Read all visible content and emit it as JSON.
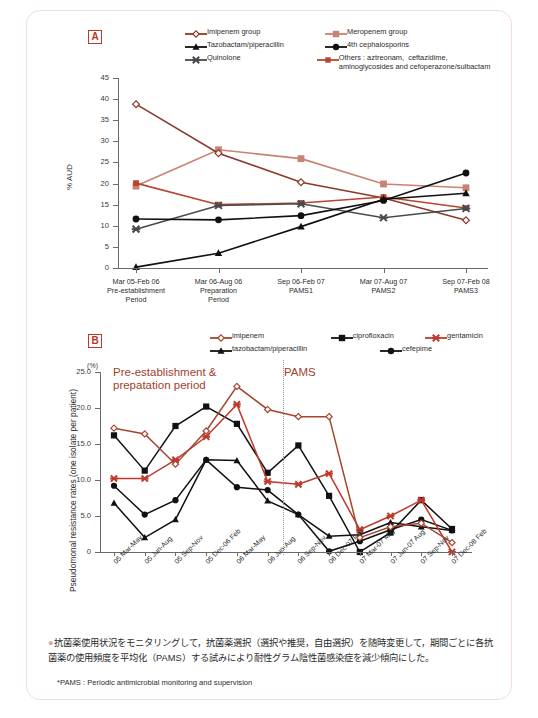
{
  "figure": {
    "panel_a_label": "A",
    "panel_b_label": "B",
    "accent_color": "#b3392b",
    "frame_color": "#f2ddda"
  },
  "panel_a": {
    "badge": "A",
    "ylabel": "% AUD",
    "legend": [
      {
        "label": "Imipenem group",
        "color": "#8c3a2a",
        "marker": "open-diamond"
      },
      {
        "label": "Meropenem group",
        "color": "#c98272",
        "marker": "filled-square"
      },
      {
        "label": "Tazobactam/piperacillin",
        "color": "#111111",
        "marker": "filled-triangle"
      },
      {
        "label": "4th cephalosporins",
        "color": "#111111",
        "marker": "filled-circle"
      },
      {
        "label": "Quinolone",
        "color": "#4a4a4a",
        "marker": "cross-x"
      },
      {
        "label": "Others : aztreonam,  ceftazidime,\naminoglycosides and cefoperazone/sulbactam",
        "color": "#b8452f",
        "marker": "filled-square-small"
      }
    ],
    "chart_data": {
      "type": "line",
      "title": "",
      "xlabel": "",
      "ylabel": "% AUD",
      "ylim": [
        0,
        45
      ],
      "yticks": [
        0,
        5,
        10,
        15,
        20,
        25,
        30,
        35,
        40,
        45
      ],
      "grid": false,
      "legend_position": "top",
      "categories": [
        "Mar 05-Feb 06\nPre-establishment\nPeriod",
        "Mar 06-Aug 06\nPreparation\nPeriod",
        "Sep 06-Feb 07\nPAMS1",
        "Mar 07-Aug 07\nPAMS2",
        "Sep 07-Feb 08\nPAMS3"
      ],
      "series": [
        {
          "name": "Imipenem group",
          "values": [
            38.8,
            27.2,
            20.3,
            16.6,
            11.3
          ]
        },
        {
          "name": "Meropenem group",
          "values": [
            19.4,
            28.0,
            25.9,
            19.9,
            19.0
          ]
        },
        {
          "name": "Tazobactam/piperacillin",
          "values": [
            0.2,
            3.5,
            9.8,
            16.3,
            17.7
          ]
        },
        {
          "name": "4th cephalosporins",
          "values": [
            11.6,
            11.4,
            12.4,
            16.0,
            22.5
          ]
        },
        {
          "name": "Quinolone",
          "values": [
            9.2,
            14.8,
            15.2,
            11.9,
            14.1
          ]
        },
        {
          "name": "Others",
          "values": [
            20.1,
            15.0,
            15.4,
            16.8,
            14.2
          ]
        }
      ]
    }
  },
  "panel_b": {
    "badge": "B",
    "ylabel": "Pseudomonal resistance rates (one isolate per patient)",
    "yunit": "(%)",
    "annotation_left": "Pre-establishment &\nprepatation period",
    "annotation_right": "PAMS",
    "legend": [
      {
        "label": "imipenem",
        "color": "#a5452f",
        "marker": "open-diamond"
      },
      {
        "label": "ciprofloxacin",
        "color": "#111111",
        "marker": "filled-square"
      },
      {
        "label": "gentamicin",
        "color": "#c0392b",
        "marker": "cross-x"
      },
      {
        "label": "tazobactam/piperacillin",
        "color": "#111111",
        "marker": "filled-triangle"
      },
      {
        "label": "cefepime",
        "color": "#111111",
        "marker": "filled-circle"
      }
    ],
    "chart_data": {
      "type": "line",
      "title": "",
      "xlabel": "",
      "ylabel": "Pseudomonal resistance rates (one isolate per patient)",
      "ylim": [
        0,
        25
      ],
      "yticks": [
        0,
        5.0,
        10.0,
        15.0,
        20.0,
        25.0
      ],
      "ytick_labels": [
        "0",
        "5.0",
        "10.0",
        "15.0",
        "20.0",
        "25.0"
      ],
      "grid": false,
      "legend_position": "top",
      "divider_after_index": 6,
      "divider_label_left": "Pre-establishment & prepatation period",
      "divider_label_right": "PAMS",
      "categories": [
        "05 Mar-May",
        "05 Jun-Aug",
        "05 Sep-Nov",
        "05 Dec-06 Feb",
        "06 Mar-May",
        "06 Jun-Aug",
        "06 Sep-Nov",
        "06 Dec-07 Feb",
        "07 Mar-07 May",
        "07 Jun-07 Aug",
        "07 Sep-Nov",
        "07 Dec-08 Feb"
      ],
      "series": [
        {
          "name": "imipenem",
          "values": [
            17.2,
            16.4,
            12.2,
            16.8,
            23.0,
            19.8,
            18.8,
            18.8,
            2.0,
            3.5,
            4.0,
            1.3
          ]
        },
        {
          "name": "ciprofloxacin",
          "values": [
            16.2,
            11.3,
            17.5,
            20.2,
            17.8,
            11.0,
            14.8,
            7.8,
            0.0,
            2.7,
            7.2,
            3.2
          ]
        },
        {
          "name": "gentamicin",
          "values": [
            10.2,
            10.2,
            12.8,
            16.0,
            20.5,
            9.8,
            9.4,
            10.9,
            3.1,
            5.0,
            7.2,
            0.0
          ]
        },
        {
          "name": "tazobactam/piperacillin",
          "values": [
            6.8,
            2.0,
            4.5,
            12.8,
            12.7,
            7.1,
            5.2,
            2.2,
            2.4,
            4.1,
            3.5,
            3.0
          ]
        },
        {
          "name": "cefepime",
          "values": [
            9.2,
            5.2,
            7.2,
            12.8,
            9.0,
            8.6,
            5.2,
            0.1,
            1.5,
            3.1,
            4.5,
            3.0
          ]
        }
      ]
    }
  },
  "footnotes": {
    "bullet_text": "抗菌薬使用状況をモニタリングして，抗菌薬選択（選択や推奨，自由選択）を随時変更して，期間ごとに各抗菌薬の使用頻度を平均化（PAMS）する試みにより耐性グラム陰性菌感染症を減少傾向にした。",
    "pams_note": "*PAMS : Periodic antimicrobial monitoring and supervision"
  }
}
